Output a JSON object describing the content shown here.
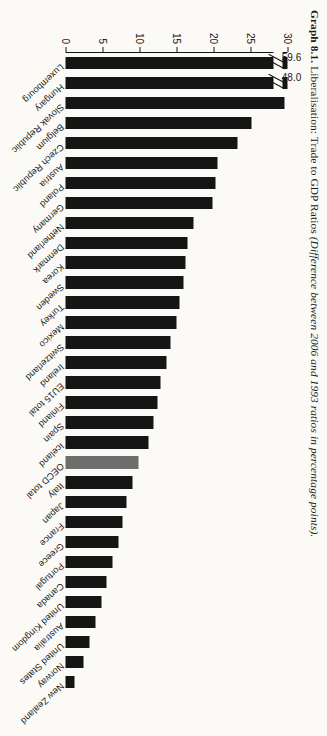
{
  "caption": {
    "number": "Graph 8.1.",
    "main": " Liberalisation: Trade to GDP Ratios ",
    "sub": "(Difference between 2006 and 1993 ratios in percentage points)."
  },
  "colors": {
    "bar": "#151515",
    "highlight": "#6d6d6d",
    "axis": "#141414",
    "background": "#fbfaf6"
  },
  "axis": {
    "ticks": [
      "0",
      "5",
      "10",
      "15",
      "20",
      "25",
      "30"
    ],
    "min": 0,
    "max": 30
  },
  "annotations": {
    "luxembourg_value": "59.6",
    "hungary_value": "48.0"
  },
  "chart_data": {
    "type": "bar",
    "title": "Graph 8.1. Liberalisation: Trade to GDP Ratios (Difference between 2006 and 1993 ratios in percentage points).",
    "orientation": "horizontal",
    "xlabel": "",
    "ylabel": "Difference in percentage points",
    "ylim": [
      0,
      30
    ],
    "grid": false,
    "legend": "none",
    "axis_break": true,
    "axis_break_note": "Luxembourg (59.6) and Hungary (48.0) bars are truncated with break marks; axis maximum shown is 30.",
    "highlighted_categories": [
      "OECD total"
    ],
    "categories": [
      "Luxembourg",
      "Hungary",
      "Slovak Republic",
      "Belgium",
      "Czech Republic",
      "Austria",
      "Poland",
      "Germany",
      "Netherland",
      "Denmark",
      "Korea",
      "Sweden",
      "Turkey",
      "Mexico",
      "Switzerland",
      "Ireland",
      "EU15 total",
      "Finland",
      "Spain",
      "Iceland",
      "OECD total",
      "Italy",
      "Japan",
      "France",
      "Greece",
      "Portugal",
      "Canada",
      "United Kingdom",
      "Australia",
      "United States",
      "Norway",
      "New Zealand"
    ],
    "values": [
      59.6,
      48.0,
      29.6,
      25.1,
      23.2,
      20.6,
      20.3,
      19.8,
      17.3,
      16.5,
      16.2,
      15.9,
      15.4,
      15.0,
      14.2,
      13.6,
      12.9,
      12.4,
      11.9,
      11.2,
      9.9,
      9.1,
      8.2,
      7.7,
      7.2,
      6.4,
      5.6,
      4.8,
      4.0,
      3.3,
      2.4,
      1.2
    ],
    "displayed_values": [
      30,
      30,
      29.6,
      25.1,
      23.2,
      20.6,
      20.3,
      19.8,
      17.3,
      16.5,
      16.2,
      15.9,
      15.4,
      15.0,
      14.2,
      13.6,
      12.9,
      12.4,
      11.9,
      11.2,
      9.9,
      9.1,
      8.2,
      7.7,
      7.2,
      6.4,
      5.6,
      4.8,
      4.0,
      3.3,
      2.4,
      1.2
    ]
  }
}
